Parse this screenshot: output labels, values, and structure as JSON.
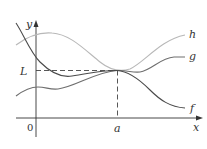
{
  "figure": {
    "axes": {
      "x_label": "x",
      "y_label": "y",
      "origin_label": "0",
      "point_a_label": "a",
      "limit_label": "L"
    },
    "curves": [
      {
        "name": "h",
        "label": "h",
        "color": "#b8b8b8"
      },
      {
        "name": "g",
        "label": "g",
        "color": "#6e6e6e"
      },
      {
        "name": "f",
        "label": "f",
        "color": "#4a4a4a"
      }
    ],
    "colors": {
      "axis": "#333333",
      "dashed": "#444444"
    }
  }
}
